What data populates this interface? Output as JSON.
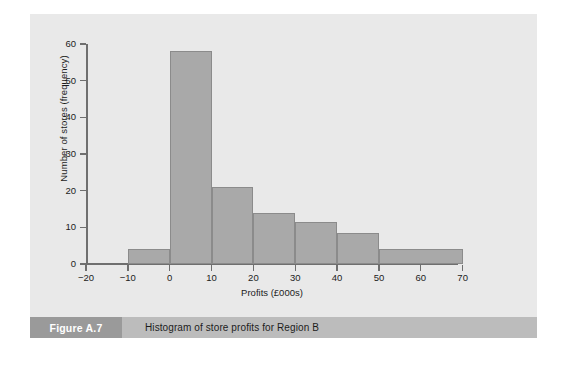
{
  "figure": {
    "label": "Figure A.7",
    "caption": "Histogram of store profits for Region B"
  },
  "colors": {
    "panel_background": "#e9e9e9",
    "bar_fill": "#a9a9a9",
    "bar_stroke": "#8b8b8b",
    "axis": "#6f6f6f",
    "caption_bar": "#bcbcbc",
    "caption_label_box": "#9a9a9a",
    "text": "#1c1c1c"
  },
  "chart_data": {
    "type": "bar",
    "title": "",
    "subtitle": "",
    "xlabel": "Profits (£000s)",
    "ylabel": "Number of stores (frequency)",
    "xlim": [
      -20,
      75
    ],
    "ylim": [
      0,
      60
    ],
    "xticks": [
      -20,
      -10,
      0,
      10,
      20,
      30,
      40,
      50,
      60,
      70
    ],
    "xtick_labels": [
      "−20",
      "−10",
      "0",
      "10",
      "20",
      "30",
      "40",
      "50",
      "60",
      "70"
    ],
    "yticks": [
      0,
      10,
      20,
      30,
      40,
      50,
      60
    ],
    "ytick_labels": [
      "0",
      "10",
      "20",
      "30",
      "40",
      "50",
      "60"
    ],
    "grid": false,
    "legend": null,
    "bin_edges": [
      -10,
      0,
      10,
      20,
      30,
      40,
      50,
      70
    ],
    "bins": [
      {
        "start": -10,
        "end": 0,
        "value": 4
      },
      {
        "start": 0,
        "end": 10,
        "value": 58
      },
      {
        "start": 10,
        "end": 20,
        "value": 21
      },
      {
        "start": 20,
        "end": 30,
        "value": 14
      },
      {
        "start": 30,
        "end": 40,
        "value": 11.5
      },
      {
        "start": 40,
        "end": 50,
        "value": 8.5
      },
      {
        "start": 50,
        "end": 70,
        "value": 4
      }
    ],
    "categories": [
      "-10 to 0",
      "0 to 10",
      "10 to 20",
      "20 to 30",
      "30 to 40",
      "40 to 50",
      "50 to 70"
    ],
    "values": [
      4,
      58,
      21,
      14,
      11.5,
      8.5,
      4
    ]
  }
}
